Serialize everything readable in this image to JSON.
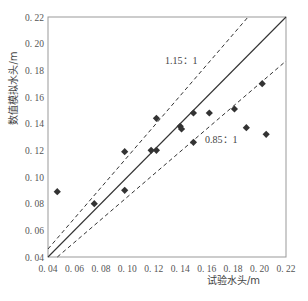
{
  "chart_data": {
    "type": "scatter",
    "title": "",
    "xlabel": "试验水头/m",
    "ylabel": "数值模拟水头/m",
    "xlim": [
      0.04,
      0.22
    ],
    "ylim": [
      0.04,
      0.22
    ],
    "xticks": [
      "0.04",
      "0.06",
      "0.08",
      "0.10",
      "0.12",
      "0.14",
      "0.16",
      "0.18",
      "0.20",
      "0.22"
    ],
    "yticks": [
      "0.04",
      "0.06",
      "0.08",
      "0.10",
      "0.12",
      "0.14",
      "0.16",
      "0.18",
      "0.20",
      "0.22"
    ],
    "grid": false,
    "legend": "none",
    "series": [
      {
        "name": "数据点",
        "marker": "diamond",
        "color": "#333333",
        "points": [
          {
            "x": 0.047,
            "y": 0.089
          },
          {
            "x": 0.075,
            "y": 0.08
          },
          {
            "x": 0.098,
            "y": 0.119
          },
          {
            "x": 0.098,
            "y": 0.09
          },
          {
            "x": 0.118,
            "y": 0.12
          },
          {
            "x": 0.122,
            "y": 0.12
          },
          {
            "x": 0.122,
            "y": 0.144
          },
          {
            "x": 0.14,
            "y": 0.138
          },
          {
            "x": 0.141,
            "y": 0.136
          },
          {
            "x": 0.15,
            "y": 0.148
          },
          {
            "x": 0.15,
            "y": 0.126
          },
          {
            "x": 0.162,
            "y": 0.148
          },
          {
            "x": 0.181,
            "y": 0.151
          },
          {
            "x": 0.19,
            "y": 0.137
          },
          {
            "x": 0.202,
            "y": 0.17
          },
          {
            "x": 0.205,
            "y": 0.132
          }
        ]
      }
    ],
    "reference_lines": [
      {
        "name": "1:1",
        "slope": 1.0,
        "style": "solid",
        "label": ""
      },
      {
        "name": "1.15:1",
        "slope": 1.15,
        "style": "dashed",
        "label": "1.15：1"
      },
      {
        "name": "0.85:1",
        "slope": 0.85,
        "style": "dashed",
        "label": "0.85：1"
      }
    ],
    "annotations": [
      {
        "text": "1.15：1",
        "x": 0.135,
        "y": 0.18
      },
      {
        "text": "0.85：1",
        "x": 0.16,
        "y": 0.122
      }
    ]
  },
  "labels": {
    "xlabel": "试验水头/m",
    "ylabel": "数值模拟水头/m",
    "upper_ratio": "1.15：1",
    "lower_ratio": "0.85：1"
  }
}
